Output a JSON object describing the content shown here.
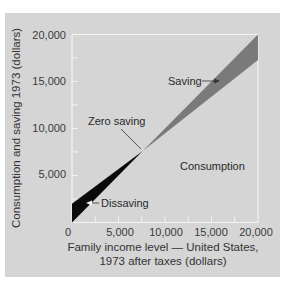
{
  "chart_data": {
    "type": "area",
    "title": "",
    "xlabel": "Family income level — United States, 1973 after taxes (dollars)",
    "xlabel_lines": [
      "Family income level — United States,",
      "1973 after taxes (dollars)"
    ],
    "ylabel": "Consumption and saving 1973 (dollars)",
    "xlim": [
      0,
      20000
    ],
    "ylim": [
      0,
      20000
    ],
    "x_ticks": [
      0,
      5000,
      10000,
      15000,
      20000
    ],
    "x_tick_labels": [
      "0",
      "5,000",
      "10,000",
      "15,000",
      "20,000"
    ],
    "y_ticks": [
      5000,
      10000,
      15000,
      20000
    ],
    "y_tick_labels": [
      "5,000",
      "10,000",
      "15,000",
      "20,000"
    ],
    "grid": false,
    "series": [
      {
        "name": "45-degree line (income)",
        "x": [
          0,
          20000
        ],
        "y": [
          0,
          20000
        ]
      },
      {
        "name": "Consumption",
        "x": [
          0,
          20000
        ],
        "y": [
          2000,
          17300
        ]
      }
    ],
    "regions": [
      {
        "name": "Dissaving",
        "x_range": [
          0,
          7600
        ],
        "color": "#0a0a0a"
      },
      {
        "name": "Saving",
        "x_range": [
          7600,
          20000
        ],
        "color": "#7a7a7a"
      }
    ],
    "annotations": [
      {
        "text": "Zero saving",
        "point": [
          7600,
          7600
        ]
      },
      {
        "text": "Saving"
      },
      {
        "text": "Consumption"
      },
      {
        "text": "Dissaving"
      }
    ],
    "colors": {
      "panel": "#d5d5d5",
      "frame": "#f4f4f4",
      "dissaving": "#0a0a0a",
      "saving": "#7a7a7a"
    }
  },
  "labels": {
    "zero_saving": "Zero saving",
    "saving": "Saving",
    "consumption": "Consumption",
    "dissaving": "Dissaving",
    "ylabel": "Consumption and saving 1973 (dollars)",
    "xlabel_line1": "Family income level — United States,",
    "xlabel_line2": "1973 after taxes (dollars)",
    "x_ticks": [
      "0",
      "5,000",
      "10,000",
      "15,000",
      "20,000"
    ],
    "y_ticks": [
      "5,000",
      "10,000",
      "15,000",
      "20,000"
    ]
  }
}
